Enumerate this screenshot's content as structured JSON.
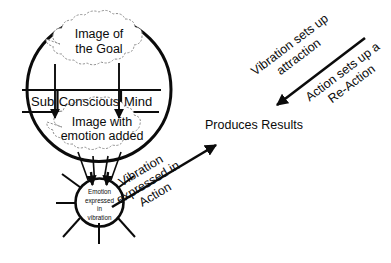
{
  "diagram": {
    "main_circle": {
      "name": "conscious-subconscious-mind-circle",
      "upper_cloud": {
        "name": "image-of-the-goal-cloud",
        "line1": "Image of",
        "line2": "the Goal"
      },
      "band": {
        "name": "sub-conscious-mind-band",
        "segment_left": "Sub",
        "segment_center": "Conscious",
        "segment_right": "Mind"
      },
      "lower_cloud": {
        "name": "image-with-emotion-added-cloud",
        "line1": "Image with",
        "line2": "emotion added"
      }
    },
    "small_circle": {
      "name": "emotion-expressed-in-vibration-circle",
      "line1": "Emotion",
      "line2": "expressed",
      "line3": "in",
      "line4": "vibration"
    },
    "labels": {
      "produces_results": "Produces Results",
      "vibration_expressed_in_action": {
        "line1": "Vibration",
        "line2": "expressed in",
        "line3": "Action"
      },
      "vibration_sets_up_attraction": {
        "line1": "Vibration sets up",
        "line2": "attraction"
      },
      "action_sets_up_a_reaction": {
        "line1": "Action sets up a",
        "line2": "Re-Action"
      }
    },
    "colors": {
      "ink": "#0b0b0b",
      "cloud_stroke": "#8e8e8e",
      "background": "#ffffff"
    }
  }
}
